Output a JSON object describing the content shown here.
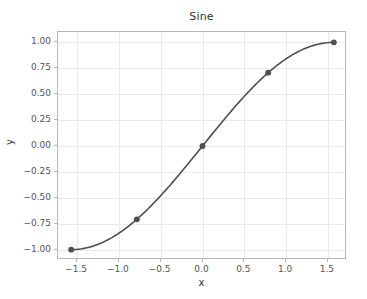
{
  "chart_data": {
    "type": "line",
    "title": "Sine",
    "xlabel": "x",
    "ylabel": "y",
    "x": [
      -1.5707963,
      -0.7853982,
      0.0,
      0.7853982,
      1.5707963
    ],
    "y": [
      -1.0,
      -0.7071068,
      0.0,
      0.7071068,
      1.0
    ],
    "series": [
      {
        "name": "sine",
        "x": [
          -1.5707963,
          -0.7853982,
          0.0,
          0.7853982,
          1.5707963
        ],
        "y": [
          -1.0,
          -0.7071068,
          0.0,
          0.7071068,
          1.0
        ]
      }
    ],
    "xlim": [
      -1.727876,
      1.727876
    ],
    "ylim": [
      -1.1,
      1.1
    ],
    "xticks": [
      -1.5,
      -1.0,
      -0.5,
      0.0,
      0.5,
      1.0,
      1.5
    ],
    "xticklabels": [
      "−1.5",
      "−1.0",
      "−0.5",
      "0.0",
      "0.5",
      "1.0",
      "1.5"
    ],
    "yticks": [
      1.0,
      0.75,
      0.5,
      0.25,
      0.0,
      -0.25,
      -0.5,
      -0.75,
      -1.0
    ],
    "yticklabels": [
      "1.00",
      "0.75",
      "0.50",
      "0.25",
      "0.00",
      "−0.25",
      "−0.50",
      "−0.75",
      "−1.00"
    ],
    "grid": true,
    "legend": null,
    "marker": "circle",
    "line_color": "#4f4f4f",
    "marker_color": "#4f4f4f",
    "grid_color": "#eaeaea",
    "frame_color": "#b7b7b7",
    "background_color": "#ffffff"
  }
}
